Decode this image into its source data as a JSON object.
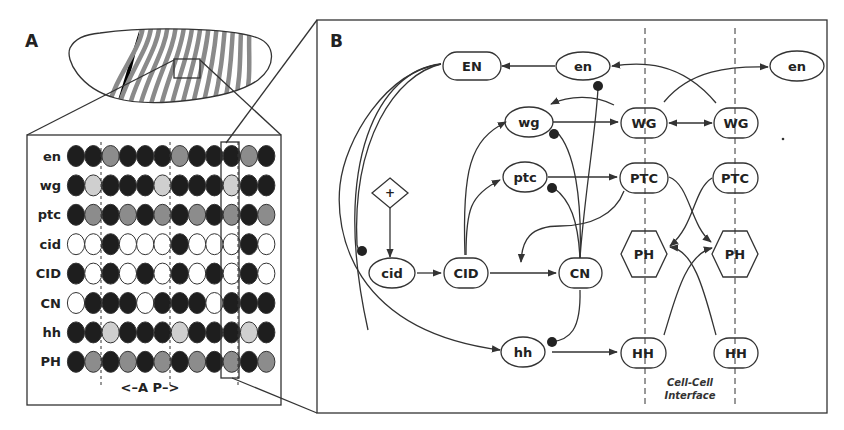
{
  "panel_a": {
    "letter": "A",
    "axis_label": "<–A  P–>",
    "rows": [
      {
        "label": "en",
        "cells": [
          "D",
          "D",
          "G",
          "D",
          "D",
          "D",
          "G",
          "D",
          "D",
          "D",
          "G",
          "D"
        ]
      },
      {
        "label": "wg",
        "cells": [
          "D",
          "L",
          "D",
          "D",
          "D",
          "L",
          "D",
          "D",
          "D",
          "L",
          "D",
          "D"
        ]
      },
      {
        "label": "ptc",
        "cells": [
          "D",
          "G",
          "D",
          "G",
          "D",
          "G",
          "D",
          "G",
          "D",
          "G",
          "D",
          "G"
        ]
      },
      {
        "label": "cid",
        "cells": [
          "W",
          "W",
          "D",
          "W",
          "W",
          "W",
          "D",
          "W",
          "W",
          "W",
          "D",
          "W"
        ]
      },
      {
        "label": "CID",
        "cells": [
          "D",
          "W",
          "D",
          "W",
          "D",
          "W",
          "D",
          "W",
          "D",
          "W",
          "D",
          "W"
        ]
      },
      {
        "label": "CN",
        "cells": [
          "W",
          "D",
          "D",
          "D",
          "W",
          "D",
          "D",
          "D",
          "W",
          "D",
          "D",
          "D"
        ]
      },
      {
        "label": "hh",
        "cells": [
          "D",
          "D",
          "L",
          "D",
          "D",
          "D",
          "L",
          "D",
          "D",
          "D",
          "L",
          "D"
        ]
      },
      {
        "label": "PH",
        "cells": [
          "D",
          "G",
          "D",
          "G",
          "D",
          "G",
          "D",
          "G",
          "D",
          "G",
          "D",
          "G"
        ]
      }
    ],
    "cell_colors": {
      "D": "#1e1e1e",
      "G": "#8c8c8c",
      "L": "#cfcfcf",
      "W": "#ffffff"
    }
  },
  "panel_b": {
    "letter": "B",
    "nodes": {
      "EN": "EN",
      "en1": "en",
      "en2": "en",
      "wg": "wg",
      "WG1": "WG",
      "WG2": "WG",
      "ptc": "ptc",
      "PTC1": "PTC",
      "PTC2": "PTC",
      "plus": "+",
      "cid": "cid",
      "CID": "CID",
      "CN": "CN",
      "PH1": "PH",
      "PH2": "PH",
      "hh": "hh",
      "HH1": "HH",
      "HH2": "HH"
    },
    "interface_label_1": "Cell-Cell",
    "interface_label_2": "Interface"
  }
}
